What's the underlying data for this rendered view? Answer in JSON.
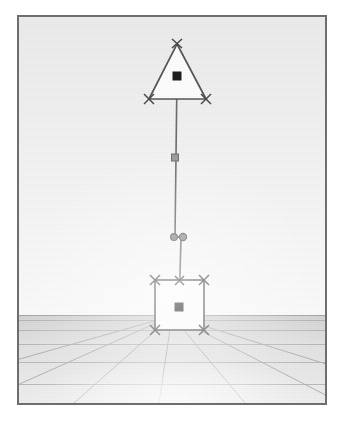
{
  "app": {
    "title": "3D Scene Viewport",
    "background_color": "#ffffff"
  },
  "viewport": {
    "name": "perspective-viewport",
    "frame_color": "#6e6e6e",
    "sky_color": "#f2f2f2",
    "ground_color": "#d9d9d9",
    "horizon_y": 298,
    "width": 306,
    "height": 386
  },
  "grid": {
    "label": "ground-grid",
    "line_color": "#a8a8a8",
    "horizon_line_color": "#9a9a9a",
    "vanishing_point_x": 153,
    "vanishing_point_y": 298,
    "depth_line_count": 7,
    "horizontal_line_count": 6,
    "horizontal_rows_y": [
      302,
      312,
      326,
      344,
      366,
      386
    ],
    "depth_lines_x_at_bottom": [
      -150,
      -40,
      55,
      140,
      225,
      320,
      430
    ]
  },
  "objects": [
    {
      "id": "triangle",
      "name": "triangle-object",
      "shape": "triangle",
      "fill": "#ffffff",
      "stroke": "#555555",
      "apex": {
        "x": 158,
        "y": 26
      },
      "base_left": {
        "x": 130,
        "y": 82
      },
      "base_right": {
        "x": 187,
        "y": 82
      },
      "center": {
        "x": 158,
        "y": 59
      },
      "selected": true,
      "vertex_handles": [
        {
          "x": 158,
          "y": 26,
          "type": "x-handle"
        },
        {
          "x": 130,
          "y": 82,
          "type": "x-handle"
        },
        {
          "x": 187,
          "y": 82,
          "type": "x-handle"
        }
      ],
      "center_handle": {
        "x": 158,
        "y": 59,
        "type": "filled-square"
      }
    },
    {
      "id": "square",
      "name": "square-object",
      "shape": "square",
      "fill": "#ffffff",
      "stroke": "#555555",
      "top_left": {
        "x": 136,
        "y": 263
      },
      "bottom_right": {
        "x": 185,
        "y": 313
      },
      "center": {
        "x": 160,
        "y": 290
      },
      "selected": true,
      "vertex_handles": [
        {
          "x": 136,
          "y": 263,
          "type": "x-handle"
        },
        {
          "x": 185,
          "y": 263,
          "type": "x-handle"
        },
        {
          "x": 136,
          "y": 313,
          "type": "x-handle"
        },
        {
          "x": 185,
          "y": 313,
          "type": "x-handle"
        }
      ],
      "center_handle": {
        "x": 160,
        "y": 290,
        "type": "filled-square"
      }
    }
  ],
  "link": {
    "name": "connector-link",
    "stroke": "#6a6a6a",
    "upper_segment": {
      "x1": 158,
      "y1": 59,
      "x2": 156,
      "y2": 220
    },
    "lower_segment": {
      "x1": 161,
      "y1": 221,
      "x2": 160,
      "y2": 290
    },
    "handles": [
      {
        "x": 156,
        "y": 141,
        "type": "square-handle",
        "name": "midpoint-handle"
      },
      {
        "x": 156,
        "y": 220,
        "type": "circle-handle",
        "name": "joint-handle-left"
      },
      {
        "x": 162,
        "y": 220,
        "type": "circle-handle",
        "name": "joint-handle-right"
      },
      {
        "x": 160,
        "y": 263,
        "type": "x-handle",
        "name": "attach-handle"
      }
    ]
  },
  "handle_style": {
    "x_handle_color": "#4a4a4a",
    "square_handle_color": "#8a8a8a",
    "circle_handle_color": "#7a7a7a",
    "center_handle_color": "#1a1a1a",
    "center_handle_outline": "#ffffff"
  }
}
